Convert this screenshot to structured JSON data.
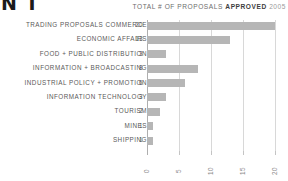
{
  "masthead": {
    "text": "N T"
  },
  "header": {
    "caption_prefix": "TOTAL # OF PROPOSALS",
    "caption_strong": "APPROVED",
    "caption_year": "2005"
  },
  "chart_data": {
    "type": "bar",
    "orientation": "horizontal",
    "title": "TOTAL # OF PROPOSALS APPROVED 2005",
    "xlabel": "",
    "ylabel": "",
    "xlim": [
      0,
      20
    ],
    "xticks": [
      "0",
      "5",
      "10",
      "15",
      "20"
    ],
    "grid": true,
    "legend": "none",
    "bar_color": "#b6b6b6",
    "categories": [
      "TRADING PROPOSALS COMMERCE",
      "ECONOMIC AFFAIRS",
      "FOOD + PUBLIC DISTRIBUTION",
      "INFORMATION + BROADCASTING",
      "INDUSTRIAL POLICY + PROMOTION",
      "INFORMATION TECHNOLOGY",
      "TOURISM",
      "MINES",
      "SHIPPING"
    ],
    "values": [
      20,
      13,
      3,
      8,
      6,
      3,
      2,
      1,
      1
    ]
  }
}
